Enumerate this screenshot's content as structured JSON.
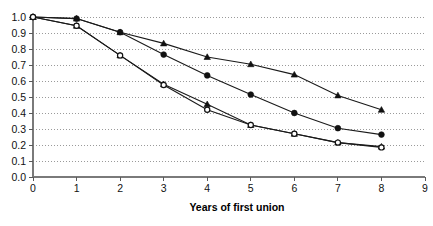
{
  "chart_data": {
    "type": "line",
    "title": "",
    "subtitle": "",
    "xlabel": "Years of first union",
    "ylabel": "",
    "xlim": [
      0,
      9
    ],
    "ylim": [
      0.0,
      1.0
    ],
    "grid": true,
    "legend_position": "none",
    "x": [
      0,
      1,
      2,
      3,
      4,
      5,
      6,
      7,
      8
    ],
    "xticks": [
      "0",
      "1",
      "2",
      "3",
      "4",
      "5",
      "6",
      "7",
      "8",
      "9"
    ],
    "yticks": [
      "0.0",
      "0.1",
      "0.2",
      "0.3",
      "0.4",
      "0.5",
      "0.6",
      "0.7",
      "0.8",
      "0.9",
      "1.0"
    ],
    "series": [
      {
        "name": "series-1",
        "marker": "filled-triangle",
        "values": [
          1.0,
          0.99,
          0.905,
          0.835,
          0.75,
          0.705,
          0.64,
          0.51,
          0.42
        ]
      },
      {
        "name": "series-2",
        "marker": "filled-circle",
        "values": [
          1.0,
          0.99,
          0.905,
          0.765,
          0.635,
          0.515,
          0.4,
          0.305,
          0.265
        ]
      },
      {
        "name": "series-3",
        "marker": "filled-triangle",
        "values": [
          1.0,
          0.945,
          0.76,
          0.58,
          0.455,
          0.325,
          0.27,
          0.215,
          0.19
        ]
      },
      {
        "name": "series-4",
        "marker": "open-circle",
        "values": [
          1.0,
          0.945,
          0.76,
          0.575,
          0.42,
          0.325,
          0.27,
          0.215,
          0.185
        ]
      }
    ],
    "colors": {
      "line": "#1a1a1a",
      "grid": "#9a9a9a",
      "axis": "#7a7a7a",
      "text": "#111111",
      "background": "#ffffff"
    }
  }
}
